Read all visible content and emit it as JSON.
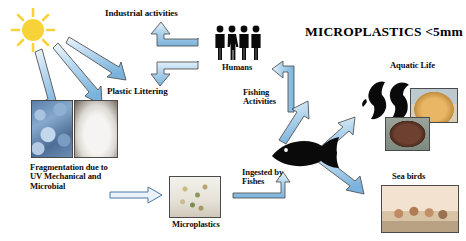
{
  "title": {
    "text": "MICROPLASTICS <5mm"
  },
  "labels": {
    "industrial": "Industrial activities",
    "plastic_littering": "Plastic Littering",
    "humans": "Humans",
    "fishing": "Fishing\nActivities",
    "fragmentation": "Fragmentation due to\nUV Mechanical and\nMicrobial",
    "microplastics": "Microplastics",
    "ingested": "Ingested by\nFishes",
    "aquatic_life": "Aquatic Life",
    "sea_birds": "Sea birds"
  },
  "icons": {
    "sun": "sun-icon",
    "people": "people-group-icon",
    "fish": "fish-silhouette-icon",
    "dolphin_left": "dolphin-silhouette-icon",
    "dolphin_right": "dolphin-silhouette-icon"
  },
  "photos": {
    "plastic_flakes": "blue-plastic-flakes-photo",
    "plastic_bag": "white-plastic-bag-photo",
    "microplastic_grains": "microplastic-grains-photo",
    "shell": "sea-shell-photo",
    "turtle": "sea-turtle-photo",
    "flamingos": "sea-birds-flamingos-photo"
  },
  "colors": {
    "arrow_fill_light": "#cfe3f3",
    "arrow_fill_mid": "#8fc0e4",
    "arrow_stroke": "#3f3f3f",
    "sun": "#f7d339",
    "text": "#0d0d0d"
  },
  "arrows": [
    {
      "name": "sun-to-plastic-1",
      "from": "sun",
      "to": "plastic-littering"
    },
    {
      "name": "sun-to-plastic-2",
      "from": "sun",
      "to": "plastic-littering"
    },
    {
      "name": "sun-to-plastic-3",
      "from": "sun",
      "to": "plastic-littering"
    },
    {
      "name": "elbow-to-industrial",
      "from": "humans",
      "to": "industrial-activities"
    },
    {
      "name": "elbow-to-plastic-littering",
      "from": "humans",
      "to": "plastic-littering"
    },
    {
      "name": "fishing-to-humans",
      "from": "fishing-activities",
      "to": "humans"
    },
    {
      "name": "fish-to-fishing",
      "from": "fish",
      "to": "fishing-activities"
    },
    {
      "name": "fragmentation-to-microplastics",
      "from": "fragmentation",
      "to": "microplastics"
    },
    {
      "name": "microplastics-to-fish",
      "from": "microplastics",
      "to": "fish"
    },
    {
      "name": "fish-to-aquatic-life",
      "from": "fish",
      "to": "aquatic-life"
    },
    {
      "name": "fish-to-sea-birds",
      "from": "fish",
      "to": "sea-birds"
    }
  ]
}
